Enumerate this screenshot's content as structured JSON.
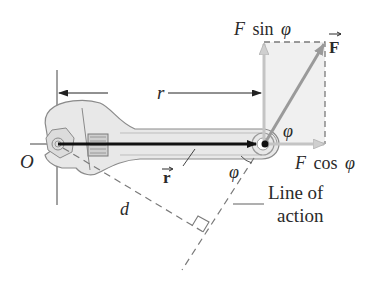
{
  "figure": {
    "type": "torque-wrench-diagram",
    "labels": {
      "origin": "O",
      "r_distance": "r",
      "r_vector": "r",
      "force_vector": "F",
      "f_sin_F": "F",
      "f_sin_fn": "sin",
      "f_sin_phi": "φ",
      "f_cos_F": "F",
      "f_cos_fn": "cos",
      "f_cos_phi": "φ",
      "phi_upper": "φ",
      "phi_lower": "φ",
      "moment_arm": "d",
      "line_of_action_1": "Line of",
      "line_of_action_2": "action"
    },
    "colors": {
      "background": "#ffffff",
      "r_vector": "#111111",
      "force_arrow": "#9a9a9a",
      "component_arrow": "#c4c4c4",
      "component_fill": "#efefef",
      "wrench_fill": "#e6e6e6",
      "wrench_stroke": "#8a8a8a",
      "dashed_line": "#7a7a7a",
      "text": "#2a2a2a"
    }
  }
}
